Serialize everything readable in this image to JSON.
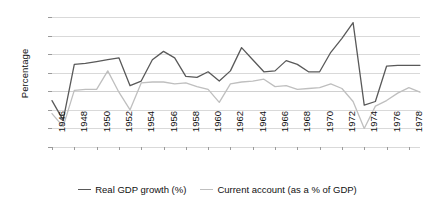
{
  "chart_data": {
    "type": "line",
    "title": "",
    "xlabel": "",
    "ylabel": "Percentage",
    "xlim": [
      1946,
      1979
    ],
    "ylim": [
      -6,
      8
    ],
    "ytick_step": 2,
    "xtick_step": 2,
    "grid": true,
    "legend_position": "bottom",
    "yticks": [
      "8",
      "6",
      "4",
      "2",
      "0",
      "-2",
      "-4",
      "-6"
    ],
    "ytick_values": [
      8,
      6,
      4,
      2,
      0,
      -2,
      -4,
      -6
    ],
    "xticks": [
      "1946",
      "1948",
      "1950",
      "1952",
      "1954",
      "1956",
      "1958",
      "1960",
      "1962",
      "1964",
      "1966",
      "1968",
      "1970",
      "1972",
      "1974",
      "1976",
      "1978"
    ],
    "xtick_values": [
      1946,
      1948,
      1950,
      1952,
      1954,
      1956,
      1958,
      1960,
      1962,
      1964,
      1966,
      1968,
      1970,
      1972,
      1974,
      1976,
      1978
    ],
    "x": [
      1946,
      1947,
      1948,
      1949,
      1950,
      1951,
      1952,
      1953,
      1954,
      1955,
      1956,
      1957,
      1958,
      1959,
      1960,
      1961,
      1962,
      1963,
      1964,
      1965,
      1966,
      1967,
      1968,
      1969,
      1970,
      1971,
      1972,
      1973,
      1974,
      1975,
      1976,
      1977,
      1978,
      1979
    ],
    "series": [
      {
        "name": "Real GDP growth (%)",
        "color": "#595959",
        "values": [
          -1.0,
          -3.1,
          2.9,
          3.0,
          3.2,
          3.4,
          3.6,
          0.6,
          1.1,
          3.4,
          4.3,
          3.6,
          1.6,
          1.5,
          2.1,
          1.1,
          2.2,
          4.7,
          3.4,
          2.1,
          2.2,
          3.3,
          2.9,
          2.1,
          2.1,
          4.2,
          5.7,
          7.4,
          -1.5,
          -1.1,
          2.7,
          2.8,
          2.8,
          2.8
        ]
      },
      {
        "name": "Current account (as a % of GDP)",
        "color": "#bfbfbf",
        "values": [
          -2.4,
          -3.8,
          0.1,
          0.2,
          0.2,
          2.2,
          -0.1,
          -2.0,
          0.9,
          1.0,
          1.0,
          0.8,
          0.9,
          0.5,
          0.2,
          -1.2,
          0.8,
          1.0,
          1.1,
          1.3,
          0.5,
          0.6,
          0.2,
          0.3,
          0.4,
          0.8,
          0.3,
          -1.1,
          -4.0,
          -1.6,
          -1.0,
          -0.2,
          0.4,
          -0.1
        ]
      }
    ],
    "legend": [
      {
        "label": "Real GDP growth (%)",
        "color": "#595959"
      },
      {
        "label": "Current account (as a % of GDP)",
        "color": "#bfbfbf"
      }
    ]
  },
  "colors": {
    "gdp_line": "#595959",
    "current_account_line": "#bfbfbf",
    "gridline": "#d9d9d9",
    "text": "#111111"
  }
}
